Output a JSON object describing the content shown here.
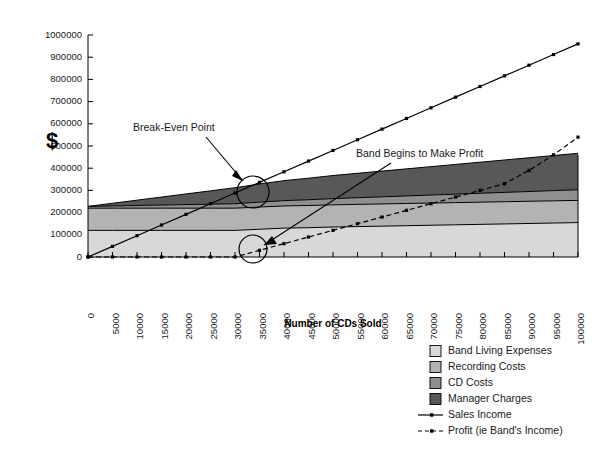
{
  "chart_data": {
    "type": "area",
    "title": "",
    "xlabel": "Number of CDs Sold",
    "ylabel": "$",
    "x": [
      0,
      5000,
      10000,
      15000,
      20000,
      25000,
      30000,
      35000,
      40000,
      45000,
      50000,
      55000,
      60000,
      65000,
      70000,
      75000,
      80000,
      85000,
      90000,
      95000,
      100000
    ],
    "xlim": [
      0,
      100000
    ],
    "ylim": [
      0,
      1000000
    ],
    "xticks": [
      "0",
      "5000",
      "10000",
      "15000",
      "20000",
      "25000",
      "30000",
      "35000",
      "40000",
      "45000",
      "50000",
      "55000",
      "60000",
      "65000",
      "70000",
      "75000",
      "80000",
      "85000",
      "90000",
      "95000",
      "100000"
    ],
    "yticks": [
      "0",
      "100000",
      "200000",
      "300000",
      "400000",
      "500000",
      "600000",
      "700000",
      "800000",
      "900000",
      "1000000"
    ],
    "grid": false,
    "legend_position": "bottom-right",
    "stacked": true,
    "series": [
      {
        "name": "Band Living Expenses",
        "kind": "area",
        "color": "#d8d8d8",
        "values": [
          120000,
          120000,
          120000,
          120000,
          120000,
          120000,
          120000,
          125000,
          130000,
          132000,
          135000,
          137000,
          139000,
          141000,
          143000,
          145000,
          147000,
          149000,
          151000,
          153000,
          155000
        ]
      },
      {
        "name": "Recording Costs",
        "kind": "area",
        "color": "#b3b3b3",
        "values": [
          100000,
          100000,
          100000,
          100000,
          100000,
          100000,
          100000,
          100000,
          100000,
          100000,
          100000,
          100000,
          100000,
          100000,
          100000,
          100000,
          100000,
          100000,
          100000,
          100000,
          100000
        ]
      },
      {
        "name": "CD Costs",
        "kind": "area",
        "color": "#8f8f8f",
        "values": [
          8000,
          10000,
          12000,
          14000,
          16000,
          18000,
          20000,
          22000,
          24000,
          26000,
          28000,
          30000,
          32000,
          34000,
          36000,
          38000,
          40000,
          42000,
          44000,
          46000,
          48000
        ]
      },
      {
        "name": "Manager Charges",
        "kind": "area",
        "color": "#585858",
        "values": [
          0,
          12000,
          24000,
          36000,
          48000,
          60000,
          72000,
          82000,
          90000,
          97000,
          104000,
          110000,
          116000,
          122000,
          128000,
          134000,
          140000,
          146000,
          152000,
          158000,
          164000
        ]
      },
      {
        "name": "Sales Income",
        "kind": "line",
        "color": "#000000",
        "style": "solid",
        "values": [
          0,
          48000,
          96000,
          144000,
          192000,
          240000,
          288000,
          336000,
          384000,
          432000,
          480000,
          528000,
          576000,
          624000,
          672000,
          720000,
          768000,
          816000,
          864000,
          912000,
          960000
        ]
      },
      {
        "name": "Profit (ie Band's Income)",
        "kind": "line",
        "color": "#000000",
        "style": "dashed",
        "values": [
          0,
          0,
          0,
          0,
          0,
          0,
          0,
          30000,
          60000,
          90000,
          120000,
          150000,
          180000,
          210000,
          240000,
          270000,
          300000,
          330000,
          390000,
          460000,
          540000
        ]
      }
    ],
    "annotations": [
      {
        "name": "break-even-point",
        "text": "Break-Even Point",
        "x": 30000,
        "y": 290000
      },
      {
        "name": "band-begins-to-make-profit",
        "text": "Band Begins to Make Profit",
        "x": 30000,
        "y": 0
      }
    ]
  },
  "legend": {
    "items": [
      {
        "label": "Band Living Expenses",
        "swatch": "#d8d8d8",
        "type": "swatch"
      },
      {
        "label": "Recording Costs",
        "swatch": "#b3b3b3",
        "type": "swatch"
      },
      {
        "label": "CD Costs",
        "swatch": "#8f8f8f",
        "type": "swatch"
      },
      {
        "label": "Manager Charges",
        "swatch": "#585858",
        "type": "swatch"
      },
      {
        "label": "Sales Income",
        "swatch": "#000000",
        "type": "line-solid"
      },
      {
        "label": "Profit (ie Band's Income)",
        "swatch": "#000000",
        "type": "line-dashed"
      }
    ]
  },
  "axes": {
    "x_title": "Number of CDs Sold",
    "y_title": "$"
  }
}
